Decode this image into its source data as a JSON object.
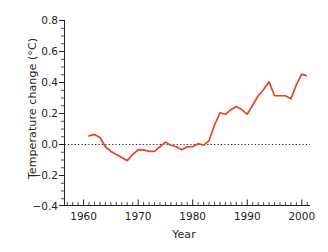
{
  "chart_data": {
    "type": "line",
    "title": "",
    "subtitle": "",
    "xlabel": "Year",
    "ylabel": "Temperature change (°C)",
    "xlim": [
      1956.5,
      2001.5
    ],
    "ylim": [
      -0.4,
      0.8
    ],
    "xticks": [
      1960,
      1970,
      1980,
      1990,
      2000
    ],
    "xtick_labels": [
      "1960",
      "1970",
      "1980",
      "1990",
      "2000"
    ],
    "x_minor_tick_interval": 1,
    "yticks": [
      -0.4,
      -0.2,
      0.0,
      0.2,
      0.4,
      0.6,
      0.8
    ],
    "ytick_labels": [
      "−0.4",
      "−0.2",
      "0.0",
      "0.2",
      "0.4",
      "0.6",
      "0.8"
    ],
    "y_minor_tick_interval": 0.05,
    "grid": false,
    "legend": "none",
    "reference_lines": [
      {
        "name": "zero-line",
        "axis": "y",
        "value": 0.0,
        "style": "dotted",
        "color": "#231f20"
      }
    ],
    "series": [
      {
        "name": "Temperature change",
        "color": "#e8432a",
        "line_width": 1.6,
        "x": [
          1961,
          1962,
          1963,
          1964,
          1965,
          1966,
          1967,
          1968,
          1969,
          1970,
          1971,
          1972,
          1973,
          1974,
          1975,
          1976,
          1977,
          1978,
          1979,
          1980,
          1981,
          1982,
          1983,
          1984,
          1985,
          1986,
          1987,
          1988,
          1989,
          1990,
          1991,
          1992,
          1993,
          1994,
          1995,
          1996,
          1997,
          1998,
          1999,
          2000
        ],
        "values": [
          0.05,
          0.06,
          0.04,
          -0.02,
          -0.05,
          -0.07,
          -0.09,
          -0.11,
          -0.07,
          -0.04,
          -0.04,
          -0.05,
          -0.05,
          -0.02,
          0.01,
          -0.01,
          -0.02,
          -0.04,
          -0.02,
          -0.02,
          0.0,
          -0.01,
          0.02,
          0.12,
          0.2,
          0.19,
          0.22,
          0.24,
          0.22,
          0.19,
          0.25,
          0.31,
          0.35,
          0.4,
          0.31,
          0.31,
          0.31,
          0.29,
          0.38,
          0.45
        ],
        "end_value": 0.44
      }
    ],
    "axis_color": "#231f20",
    "background_color": "#ffffff"
  },
  "axes": {
    "x_title": "Year",
    "y_title": "Temperature change (°C)"
  }
}
